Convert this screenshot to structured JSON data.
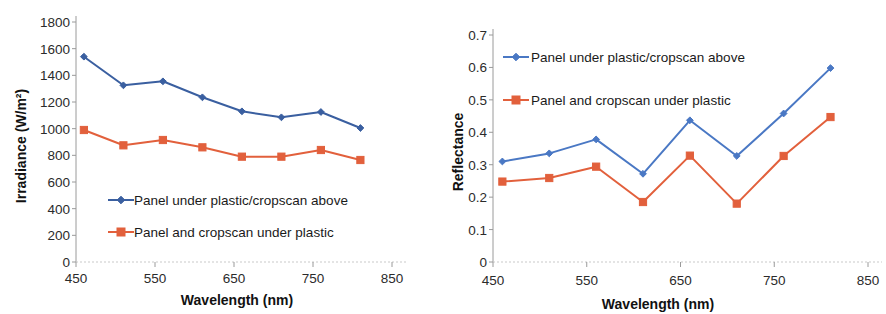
{
  "figure": {
    "panels": [
      "irradiance-chart",
      "reflectance-chart"
    ]
  },
  "series_names": {
    "s1": "Panel under plastic/cropscan above",
    "s2": "Panel and cropscan under plastic"
  },
  "colors": {
    "series1": "#3A5FA0",
    "series2": "#E2603C",
    "series1_right": "#4A78C4",
    "axis": "#9a9a9a",
    "text": "#1a1a1a",
    "background": "#ffffff"
  },
  "chart_data": [
    {
      "type": "line",
      "id": "irradiance-chart",
      "title": "",
      "xlabel": "Wavelength (nm)",
      "ylabel": "Irradiance (W/m²)",
      "xlim": [
        450,
        850
      ],
      "ylim": [
        0,
        1800
      ],
      "xticks": [
        450,
        550,
        650,
        750,
        850
      ],
      "xticklabels": [
        "450",
        "550",
        "650",
        "750",
        "850"
      ],
      "yticks": [
        0,
        200,
        400,
        600,
        800,
        1000,
        1200,
        1400,
        1600,
        1800
      ],
      "yticklabels": [
        "0",
        "200",
        "400",
        "600",
        "800",
        "1000",
        "1200",
        "1400",
        "1600",
        "1800"
      ],
      "grid": false,
      "legend_position": "inside-lower-center",
      "x": [
        460,
        510,
        560,
        610,
        660,
        710,
        760,
        810
      ],
      "series": [
        {
          "name": "Panel under plastic/cropscan above",
          "color": "#3A5FA0",
          "marker": "diamond",
          "values": [
            1540,
            1325,
            1355,
            1235,
            1130,
            1085,
            1125,
            1005
          ]
        },
        {
          "name": "Panel and cropscan under plastic",
          "color": "#E2603C",
          "marker": "square",
          "values": [
            990,
            875,
            915,
            860,
            790,
            790,
            840,
            765
          ]
        }
      ]
    },
    {
      "type": "line",
      "id": "reflectance-chart",
      "title": "",
      "xlabel": "Wavelength (nm)",
      "ylabel": "Reflectance",
      "xlim": [
        450,
        850
      ],
      "ylim": [
        0,
        0.7
      ],
      "xticks": [
        450,
        550,
        650,
        750,
        850
      ],
      "xticklabels": [
        "450",
        "550",
        "650",
        "750",
        "850"
      ],
      "yticks": [
        0,
        0.1,
        0.2,
        0.3,
        0.4,
        0.5,
        0.6,
        0.7
      ],
      "yticklabels": [
        "0",
        "0.1",
        "0.2",
        "0.3",
        "0.4",
        "0.5",
        "0.6",
        "0.7"
      ],
      "grid": false,
      "legend_position": "inside-upper-left",
      "x": [
        460,
        510,
        560,
        610,
        660,
        710,
        760,
        810
      ],
      "series": [
        {
          "name": "Panel under plastic/cropscan above",
          "color": "#4A78C4",
          "marker": "diamond",
          "values": [
            0.31,
            0.335,
            0.378,
            0.272,
            0.437,
            0.327,
            0.458,
            0.598
          ]
        },
        {
          "name": "Panel and cropscan under plastic",
          "color": "#E2603C",
          "marker": "square",
          "values": [
            0.248,
            0.259,
            0.294,
            0.185,
            0.328,
            0.18,
            0.327,
            0.447
          ]
        }
      ]
    }
  ]
}
